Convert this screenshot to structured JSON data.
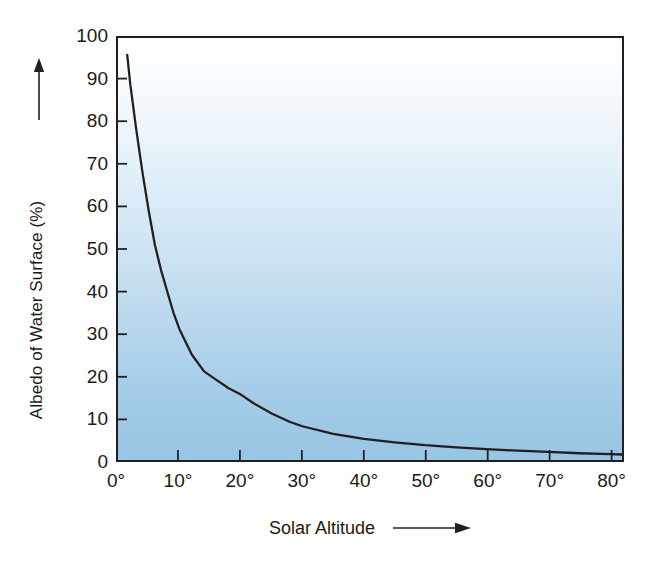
{
  "chart_data": {
    "type": "line",
    "title": "",
    "subtitle": "",
    "xlabel": "Solar Altitude",
    "ylabel": "Albedo of Water Surface (%)",
    "xlabel_arrow": "right-arrow",
    "ylabel_arrow": "up-arrow",
    "xlim": [
      0,
      82
    ],
    "ylim": [
      0,
      100
    ],
    "grid": false,
    "legend": null,
    "x_unit": "degrees",
    "y_unit": "percent",
    "xticks": [
      0,
      10,
      20,
      30,
      40,
      50,
      60,
      70,
      80
    ],
    "xtick_labels": [
      "0°",
      "10°",
      "20°",
      "30°",
      "40°",
      "50°",
      "60°",
      "70°",
      "80°"
    ],
    "yticks": [
      0,
      10,
      20,
      30,
      40,
      50,
      60,
      70,
      80,
      90,
      100
    ],
    "ytick_labels": [
      "0",
      "10",
      "20",
      "30",
      "40",
      "50",
      "60",
      "70",
      "80",
      "90",
      "100"
    ],
    "series": [
      {
        "name": "Albedo of water surface",
        "color": "#231f20",
        "x": [
          1.5,
          2,
          3,
          4,
          5,
          6,
          7,
          8,
          9,
          10,
          12,
          14,
          16,
          18,
          20,
          22,
          25,
          28,
          30,
          35,
          40,
          45,
          50,
          55,
          60,
          65,
          70,
          75,
          80,
          82
        ],
        "y": [
          96,
          89,
          78,
          68,
          59,
          51,
          45,
          40,
          35,
          31,
          25,
          21,
          19,
          17,
          15.5,
          13.5,
          11,
          9,
          8,
          6.2,
          5,
          4.2,
          3.5,
          3,
          2.6,
          2.2,
          1.9,
          1.6,
          1.4,
          1.3
        ]
      }
    ],
    "plot_background": {
      "type": "vertical-gradient",
      "top_color": "#ffffff",
      "bottom_color": "#98c5e4"
    },
    "axis_color": "#231f20",
    "page_background": "#ffffff"
  }
}
